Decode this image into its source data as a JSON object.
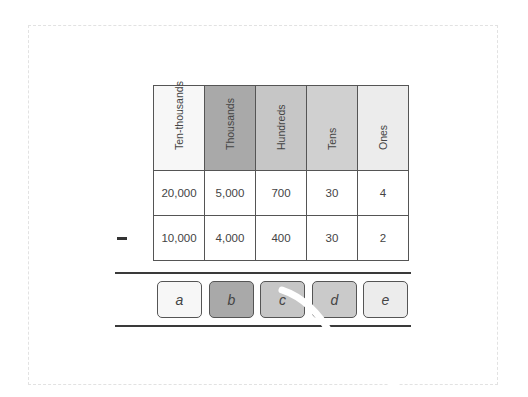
{
  "diagram": {
    "type": "place-value-subtraction",
    "columns": [
      {
        "label": "Ten-thousands",
        "color": "#f7f7f7"
      },
      {
        "label": "Thousands",
        "color": "#a9a9a9"
      },
      {
        "label": "Hundreds",
        "color": "#c6c6c6"
      },
      {
        "label": "Tens",
        "color": "#d0d0d0"
      },
      {
        "label": "Ones",
        "color": "#ececec"
      }
    ],
    "rows": [
      {
        "operator": "",
        "values": [
          "20,000",
          "5,000",
          "700",
          "30",
          "4"
        ]
      },
      {
        "operator": "minus",
        "values": [
          "10,000",
          "4,000",
          "400",
          "30",
          "2"
        ]
      }
    ],
    "answer_boxes": [
      {
        "label": "a",
        "color": "#f7f7f7"
      },
      {
        "label": "b",
        "color": "#a9a9a9"
      },
      {
        "label": "c",
        "color": "#c6c6c6"
      },
      {
        "label": "d",
        "color": "#cacaca"
      },
      {
        "label": "e",
        "color": "#ececec"
      }
    ]
  }
}
